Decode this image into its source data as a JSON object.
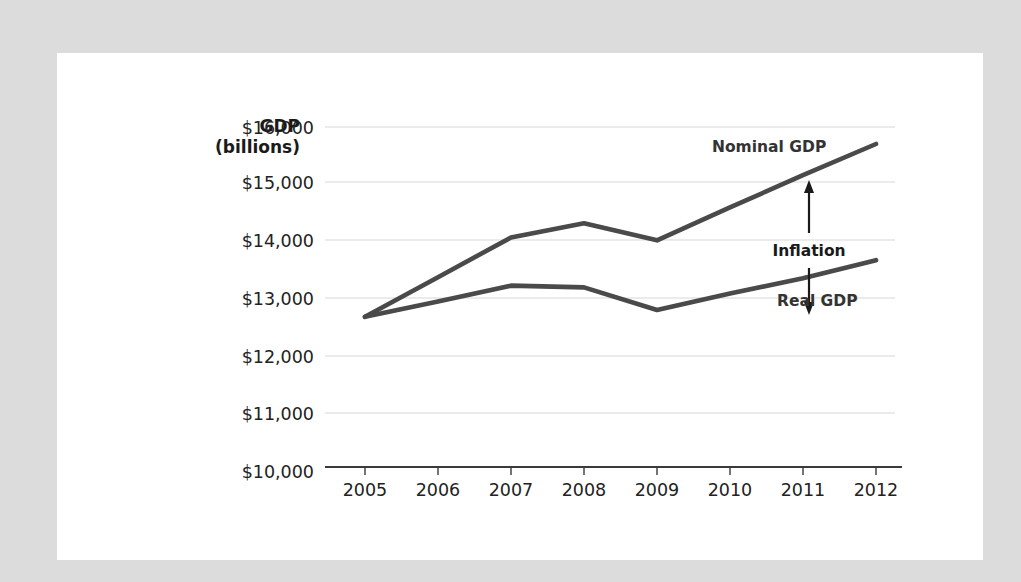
{
  "canvas": {
    "background_color": "#dcdcdc",
    "card_color": "#ffffff"
  },
  "chart_data": {
    "type": "line",
    "title": "",
    "subtitle": "",
    "xlabel": "",
    "ylabel": "GDP",
    "ylabel_line2": "(billions)",
    "x": [
      "2005",
      "2006",
      "2007",
      "2008",
      "2009",
      "2010",
      "2011",
      "2012"
    ],
    "categories": [
      "2005",
      "2006",
      "2007",
      "2008",
      "2009",
      "2010",
      "2011",
      "2012"
    ],
    "series": [
      {
        "name": "Nominal GDP",
        "color": "#4a4a4a",
        "values": [
          12650,
          13350,
          14050,
          14300,
          14000,
          14580,
          15150,
          15700
        ]
      },
      {
        "name": "Real GDP",
        "color": "#4a4a4a",
        "values": [
          12650,
          12920,
          13200,
          13170,
          12770,
          13060,
          13330,
          13650
        ]
      }
    ],
    "ylim": [
      10000,
      16000
    ],
    "ytick_values": [
      10000,
      11000,
      12000,
      13000,
      14000,
      15000,
      16000
    ],
    "ytick_labels": [
      "$10,000",
      "$11,000",
      "$12,000",
      "$13,000",
      "$14,000",
      "$15,000",
      "$16,000"
    ],
    "grid": true,
    "grid_axis": "y",
    "legend": "none",
    "legend_position": "inline-labels",
    "annotations": [
      {
        "text": "Nominal GDP",
        "type": "series-label",
        "x": 2010.7,
        "y": 15150
      },
      {
        "text": "Inflation",
        "type": "double-arrow-label",
        "x": 2011.0,
        "y_top": 15150,
        "y_bottom": 13330,
        "arrow": "double-headed-vertical"
      },
      {
        "text": "Real GDP",
        "type": "series-label",
        "x": 2010.9,
        "y": 13100
      }
    ]
  },
  "axis": {
    "y_title": "GDP",
    "y_title_sub": "(billions)",
    "ticks_y": [
      "$16,000",
      "$15,000",
      "$14,000",
      "$13,000",
      "$12,000",
      "$11,000",
      "$10,000"
    ],
    "ticks_x": [
      "2005",
      "2006",
      "2007",
      "2008",
      "2009",
      "2010",
      "2011",
      "2012"
    ]
  },
  "labels": {
    "nominal_gdp": "Nominal GDP",
    "inflation": "Inflation",
    "real_gdp": "Real GDP"
  }
}
